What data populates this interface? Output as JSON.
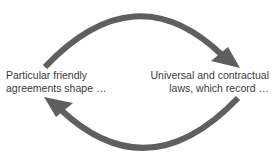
{
  "diagram": {
    "type": "cycle",
    "colors": {
      "arrow": "#5f5f5f",
      "text": "#3a3a3a",
      "background": "#ffffff"
    },
    "nodes": [
      {
        "id": "left",
        "lines": [
          "Particular friendly",
          "agreements shape …"
        ]
      },
      {
        "id": "right",
        "lines": [
          "Universal and contractual",
          "laws, which record …"
        ]
      }
    ],
    "arrows": [
      {
        "from": "left",
        "to": "right",
        "position": "top"
      },
      {
        "from": "right",
        "to": "left",
        "position": "bottom"
      }
    ]
  }
}
